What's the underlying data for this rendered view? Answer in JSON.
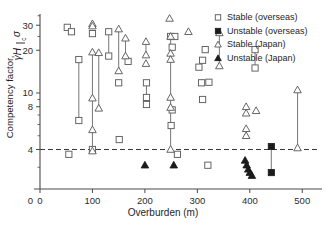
{
  "chart_data": {
    "type": "scatter",
    "title": "",
    "xlabel": "Overburden (m)",
    "ylabel": "Competency factor, σc / γH",
    "ylabel_parts": {
      "prefix": "Competency factor,",
      "numerator": "σ",
      "numerator_sub": "c",
      "denominator": "γH"
    },
    "xlim": [
      0,
      530
    ],
    "ylim": [
      2.4,
      36
    ],
    "yscale": "log",
    "xscale": "linear",
    "grid": false,
    "legend_position": "top-right",
    "xticks": [
      0,
      100,
      200,
      300,
      400,
      500
    ],
    "xticklabels": [
      "0",
      "100",
      "200",
      "300",
      "400",
      "500"
    ],
    "yticks": [
      4,
      8,
      10,
      20,
      30
    ],
    "yticklabels": [
      "4",
      "8",
      "10",
      "20",
      "30"
    ],
    "yminorticks": [
      3,
      5,
      6,
      7,
      9,
      25,
      35
    ],
    "annotations": [
      {
        "name": "competency-threshold",
        "type": "hline",
        "y": 4,
        "style": "dashed",
        "label": ""
      }
    ],
    "series": [
      {
        "name": "Stable (overseas)",
        "key": "stable_overseas",
        "marker": "open-square",
        "points": [
          {
            "x": 52,
            "y": 29.0
          },
          {
            "x": 60,
            "y": 27.0
          },
          {
            "x": 74,
            "y": 17.2
          },
          {
            "x": 74,
            "y": 6.4
          },
          {
            "x": 55,
            "y": 3.7
          },
          {
            "x": 100,
            "y": 26.2
          },
          {
            "x": 100,
            "y": 4.0
          },
          {
            "x": 131,
            "y": 27.0
          },
          {
            "x": 131,
            "y": 18.2
          },
          {
            "x": 150,
            "y": 11.8
          },
          {
            "x": 151,
            "y": 4.7
          },
          {
            "x": 168,
            "y": 16.7
          },
          {
            "x": 203,
            "y": 11.8
          },
          {
            "x": 203,
            "y": 9.3
          },
          {
            "x": 203,
            "y": 8.3
          },
          {
            "x": 249,
            "y": 25.0
          },
          {
            "x": 257,
            "y": 25.0
          },
          {
            "x": 252,
            "y": 21.0
          },
          {
            "x": 252,
            "y": 7.6
          },
          {
            "x": 250,
            "y": 5.9
          },
          {
            "x": 262,
            "y": 3.7
          },
          {
            "x": 303,
            "y": 15.2
          },
          {
            "x": 310,
            "y": 17.0
          },
          {
            "x": 315,
            "y": 20.2
          },
          {
            "x": 308,
            "y": 11.8
          },
          {
            "x": 322,
            "y": 11.9
          },
          {
            "x": 310,
            "y": 9.0
          },
          {
            "x": 320,
            "y": 3.1
          },
          {
            "x": 410,
            "y": 20.2
          },
          {
            "x": 410,
            "y": 15.0
          }
        ]
      },
      {
        "name": "Unstable (overseas)",
        "key": "unstable_overseas",
        "marker": "filled-square",
        "points": [
          {
            "x": 441,
            "y": 4.2
          },
          {
            "x": 441,
            "y": 2.75
          }
        ]
      },
      {
        "name": "Stable (Japan)",
        "key": "stable_japan",
        "marker": "open-triangle",
        "points": [
          {
            "x": 100,
            "y": 30.7
          },
          {
            "x": 100,
            "y": 29.6
          },
          {
            "x": 100,
            "y": 19.4
          },
          {
            "x": 100,
            "y": 9.2
          },
          {
            "x": 100,
            "y": 5.5
          },
          {
            "x": 100,
            "y": 3.9
          },
          {
            "x": 112,
            "y": 19.2
          },
          {
            "x": 112,
            "y": 7.8
          },
          {
            "x": 150,
            "y": 28.2
          },
          {
            "x": 150,
            "y": 14.3
          },
          {
            "x": 163,
            "y": 24.3
          },
          {
            "x": 163,
            "y": 18.2
          },
          {
            "x": 202,
            "y": 23.0
          },
          {
            "x": 202,
            "y": 18.5
          },
          {
            "x": 202,
            "y": 16.1
          },
          {
            "x": 249,
            "y": 25.0
          },
          {
            "x": 249,
            "y": 19.0
          },
          {
            "x": 249,
            "y": 17.2
          },
          {
            "x": 249,
            "y": 9.3
          },
          {
            "x": 249,
            "y": 7.9
          },
          {
            "x": 249,
            "y": 4.0
          },
          {
            "x": 247,
            "y": 33.5
          },
          {
            "x": 283,
            "y": 27.0
          },
          {
            "x": 342,
            "y": 26.5
          },
          {
            "x": 342,
            "y": 15.5
          },
          {
            "x": 393,
            "y": 8.0
          },
          {
            "x": 393,
            "y": 7.2
          },
          {
            "x": 393,
            "y": 5.6
          },
          {
            "x": 393,
            "y": 5.0
          },
          {
            "x": 412,
            "y": 7.5
          },
          {
            "x": 491,
            "y": 10.5
          },
          {
            "x": 491,
            "y": 4.1
          }
        ]
      },
      {
        "name": "Unstable (Japan)",
        "key": "unstable_japan",
        "marker": "filled-triangle",
        "points": [
          {
            "x": 200,
            "y": 3.1
          },
          {
            "x": 255,
            "y": 3.1
          },
          {
            "x": 391,
            "y": 3.35
          },
          {
            "x": 394,
            "y": 3.1
          },
          {
            "x": 397,
            "y": 2.9
          },
          {
            "x": 400,
            "y": 2.75
          },
          {
            "x": 404,
            "y": 2.62
          }
        ]
      }
    ],
    "range_bars": [
      {
        "x": 74,
        "y1": 17.2,
        "y2": 6.4
      },
      {
        "x": 100,
        "y1": 19.4,
        "y2": 3.9
      },
      {
        "x": 112,
        "y1": 19.2,
        "y2": 7.8
      },
      {
        "x": 131,
        "y1": 27.0,
        "y2": 18.2
      },
      {
        "x": 150,
        "y1": 28.2,
        "y2": 14.3
      },
      {
        "x": 163,
        "y1": 24.3,
        "y2": 18.2
      },
      {
        "x": 202,
        "y1": 23.0,
        "y2": 18.5
      },
      {
        "x": 203,
        "y1": 11.8,
        "y2": 8.3
      },
      {
        "x": 249,
        "y1": 25.0,
        "y2": 4.0
      },
      {
        "x": 342,
        "y1": 26.5,
        "y2": 15.5
      },
      {
        "x": 410,
        "y1": 20.2,
        "y2": 15.0
      },
      {
        "x": 441,
        "y1": 4.2,
        "y2": 2.75
      },
      {
        "x": 491,
        "y1": 10.5,
        "y2": 4.1
      }
    ]
  },
  "legend": {
    "items": [
      {
        "label": "Stable (overseas)",
        "marker": "open-square"
      },
      {
        "label": "Unstable (overseas)",
        "marker": "filled-square"
      },
      {
        "label": "Stable (Japan)",
        "marker": "open-triangle"
      },
      {
        "label": "Unstable (Japan)",
        "marker": "filled-triangle"
      }
    ]
  },
  "colors": {
    "axis": "#4a4a4a",
    "marker_open_stroke": "#5e5e5e",
    "marker_fill": "#1b1b1b",
    "range_bar": "#7d7d7d",
    "threshold": "#3a3a3a",
    "background": "#ffffff"
  }
}
